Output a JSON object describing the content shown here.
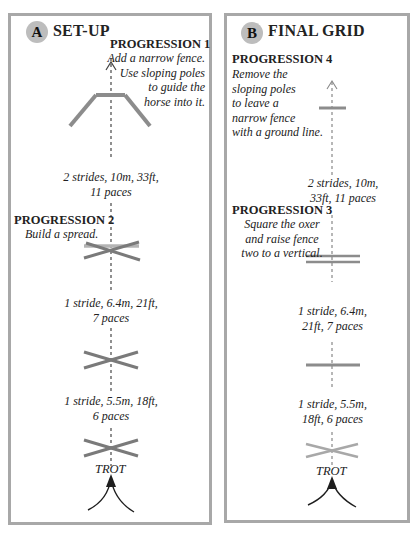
{
  "colors": {
    "border": "#a8a8a8",
    "pole": "#8a8a8a",
    "pole_light": "#b4b4b4",
    "badge": "#bdbdbd",
    "arrow": "#1e1e1e",
    "text": "#222222"
  },
  "panel_a": {
    "badge": "A",
    "title": "SET-UP",
    "progression_1": {
      "title": "PROGRESSION 1",
      "lines": [
        "Add a narrow fence.",
        "Use sloping poles",
        "to guide the",
        "horse into it."
      ]
    },
    "distance_1": [
      "2 strides, 10m, 33ft,",
      "11 paces"
    ],
    "progression_2": {
      "title": "PROGRESSION 2",
      "lines": [
        "Build a spread."
      ]
    },
    "distance_2": [
      "1 stride, 6.4m, 21ft,",
      "7 paces"
    ],
    "distance_3": [
      "1 stride, 5.5m, 18ft,",
      "6 paces"
    ],
    "trot_label": "TROT",
    "fences": [
      "narrow fence with sloping poles",
      "spread (cross with back pole)",
      "cross pole",
      "cross pole"
    ]
  },
  "panel_b": {
    "badge": "B",
    "title": "FINAL GRID",
    "progression_4": {
      "title": "PROGRESSION 4",
      "lines": [
        "Remove the",
        "sloping poles",
        "to leave a",
        "narrow fence",
        "with a ground line."
      ]
    },
    "distance_1": [
      "2 strides, 10m,",
      "33ft, 11 paces"
    ],
    "progression_3": {
      "title": "PROGRESSION 3",
      "lines": [
        "Square the oxer",
        "and raise fence",
        "two to a vertical."
      ]
    },
    "distance_2": [
      "1 stride, 6.4m,",
      "21ft, 7 paces"
    ],
    "distance_3": [
      "1 stride, 5.5m,",
      "18ft, 6 paces"
    ],
    "trot_label": "TROT",
    "fences": [
      "narrow fence with ground line",
      "square oxer",
      "vertical",
      "cross pole"
    ]
  }
}
